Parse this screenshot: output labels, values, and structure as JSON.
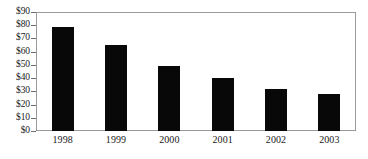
{
  "chart_data": {
    "type": "bar",
    "title": "",
    "subtitle": "",
    "xlabel": "",
    "ylabel": "",
    "categories": [
      "1998",
      "1999",
      "2000",
      "2001",
      "2002",
      "2003"
    ],
    "values": [
      79,
      65,
      49,
      40,
      32,
      28
    ],
    "value_prefix": "$",
    "ylim": [
      0,
      90
    ],
    "ytick_step": 10,
    "ytick_labels": [
      "$90",
      "$80",
      "$70",
      "$60",
      "$50",
      "$40",
      "$30",
      "$20",
      "$10",
      "$0"
    ],
    "ytick_values": [
      90,
      80,
      70,
      60,
      50,
      40,
      30,
      20,
      10,
      0
    ],
    "grid": false,
    "legend": false,
    "legend_position": "none",
    "bar_color": "#080808",
    "frame_color": "#9a9a9a",
    "background_color": "#ffffff",
    "text_color": "#1a1a1a",
    "annotations": []
  }
}
